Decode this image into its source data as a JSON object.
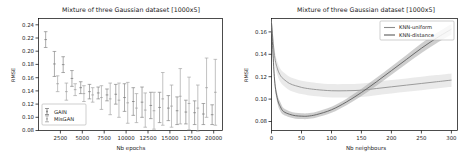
{
  "figure": {
    "background": "#ffffff",
    "width": 470,
    "height": 159
  },
  "chart_data": [
    {
      "id": "left",
      "type": "scatter",
      "title": "Mixture of three Gaussian dataset [1000x5]",
      "xlabel": "Nb epochs",
      "ylabel": "RMSE",
      "xlim": [
        0,
        21000
      ],
      "ylim": [
        0.08,
        0.25
      ],
      "xticks": [
        2500,
        5000,
        7500,
        10000,
        12500,
        15000,
        17500,
        20000
      ],
      "xticklabels": [
        "2500",
        "5000",
        "7500",
        "10000",
        "12500",
        "15000",
        "17500",
        "20000"
      ],
      "yticks": [
        0.08,
        0.1,
        0.12,
        0.14,
        0.16,
        0.18,
        0.2,
        0.22,
        0.24
      ],
      "yticklabels": [
        "0.08",
        "0.10",
        "0.12",
        "0.14",
        "0.16",
        "0.18",
        "0.20",
        "0.22",
        "0.24"
      ],
      "grid": false,
      "legend": {
        "position": "lower-left",
        "entries": [
          "GAIN",
          "MisGAN"
        ]
      },
      "series": [
        {
          "name": "GAIN",
          "color": "#7f7f7f",
          "marker": "errorbar",
          "x": [
            1000,
            2000,
            3000,
            4000,
            5000,
            6000,
            7000,
            8000,
            9000,
            10000,
            11000,
            12000,
            13000,
            14000,
            15000,
            16000,
            17000,
            18000,
            19000,
            20000
          ],
          "y": [
            0.218,
            0.181,
            0.18,
            0.159,
            0.145,
            0.139,
            0.137,
            0.134,
            0.135,
            0.13,
            0.124,
            0.123,
            0.118,
            0.115,
            0.114,
            0.11,
            0.108,
            0.107,
            0.105,
            0.104
          ],
          "yerr": [
            0.012,
            0.019,
            0.012,
            0.012,
            0.009,
            0.011,
            0.009,
            0.009,
            0.015,
            0.021,
            0.021,
            0.023,
            0.02,
            0.023,
            0.019,
            0.021,
            0.018,
            0.018,
            0.016,
            0.015
          ]
        },
        {
          "name": "MisGAN",
          "color": "#a0a0a0",
          "marker": "errorbar",
          "x": [
            2000,
            3000,
            4000,
            5000,
            6000,
            7000,
            8000,
            9000,
            10000,
            11000,
            12000,
            13000,
            14000,
            15000,
            16000,
            17000,
            18000,
            19000,
            20000
          ],
          "y": [
            0.151,
            0.139,
            0.142,
            0.136,
            0.134,
            0.13,
            0.128,
            0.126,
            0.122,
            0.114,
            0.111,
            0.11,
            0.128,
            0.117,
            0.132,
            0.121,
            0.114,
            0.145,
            0.138
          ],
          "yerr": [
            0.012,
            0.013,
            0.009,
            0.012,
            0.011,
            0.018,
            0.024,
            0.026,
            0.031,
            0.022,
            0.026,
            0.028,
            0.04,
            0.032,
            0.042,
            0.04,
            0.035,
            0.045,
            0.05
          ]
        }
      ]
    },
    {
      "id": "right",
      "type": "line",
      "title": "Mixture of three Gaussian dataset [1000x5]",
      "xlabel": "Nb neighbours",
      "ylabel": "RMSE",
      "xlim": [
        0,
        310
      ],
      "ylim": [
        0.072,
        0.172
      ],
      "xticks": [
        0,
        50,
        100,
        150,
        200,
        250,
        300
      ],
      "xticklabels": [
        "0",
        "50",
        "100",
        "150",
        "200",
        "250",
        "300"
      ],
      "yticks": [
        0.08,
        0.1,
        0.12,
        0.14,
        0.16
      ],
      "yticklabels": [
        "0.08",
        "0.10",
        "0.12",
        "0.14",
        "0.16"
      ],
      "grid": false,
      "legend": {
        "position": "upper-right",
        "entries": [
          "KNN-uniform",
          "KNN-distance"
        ]
      },
      "series": [
        {
          "name": "KNN-uniform",
          "color": "#8c8c8c",
          "band_color": "#d9d9d9",
          "x": [
            0,
            5,
            10,
            15,
            20,
            30,
            40,
            50,
            60,
            75,
            100,
            125,
            150,
            175,
            200,
            225,
            250,
            275,
            300
          ],
          "y": [
            0.168,
            0.139,
            0.127,
            0.121,
            0.118,
            0.114,
            0.112,
            0.1105,
            0.1095,
            0.1085,
            0.1075,
            0.1075,
            0.108,
            0.1095,
            0.111,
            0.1125,
            0.114,
            0.1155,
            0.117
          ],
          "y_lower": [
            0.163,
            0.133,
            0.121,
            0.115,
            0.112,
            0.108,
            0.106,
            0.1045,
            0.1035,
            0.1025,
            0.1015,
            0.1015,
            0.102,
            0.1035,
            0.105,
            0.1065,
            0.108,
            0.1095,
            0.111
          ],
          "y_upper": [
            0.173,
            0.145,
            0.133,
            0.127,
            0.124,
            0.12,
            0.118,
            0.1165,
            0.1155,
            0.1145,
            0.1135,
            0.1135,
            0.114,
            0.1155,
            0.117,
            0.1185,
            0.12,
            0.1215,
            0.123
          ]
        },
        {
          "name": "KNN-distance",
          "color": "#595959",
          "band_color": "#a6a6a6",
          "x": [
            0,
            5,
            10,
            15,
            20,
            30,
            40,
            50,
            60,
            75,
            100,
            125,
            150,
            175,
            200,
            225,
            250,
            275,
            300
          ],
          "y": [
            0.168,
            0.118,
            0.1,
            0.093,
            0.089,
            0.0865,
            0.0852,
            0.0848,
            0.0848,
            0.0862,
            0.0905,
            0.0975,
            0.106,
            0.1155,
            0.1255,
            0.1355,
            0.1455,
            0.1545,
            0.1625
          ],
          "y_lower": [
            0.164,
            0.114,
            0.096,
            0.089,
            0.086,
            0.0838,
            0.0826,
            0.0822,
            0.0822,
            0.0836,
            0.0878,
            0.0946,
            0.1028,
            0.112,
            0.1218,
            0.1315,
            0.1412,
            0.15,
            0.1578
          ],
          "y_upper": [
            0.172,
            0.122,
            0.104,
            0.097,
            0.092,
            0.0892,
            0.0878,
            0.0874,
            0.0874,
            0.0888,
            0.0932,
            0.1004,
            0.1092,
            0.119,
            0.1292,
            0.1395,
            0.1498,
            0.159,
            0.1672
          ]
        }
      ]
    }
  ]
}
